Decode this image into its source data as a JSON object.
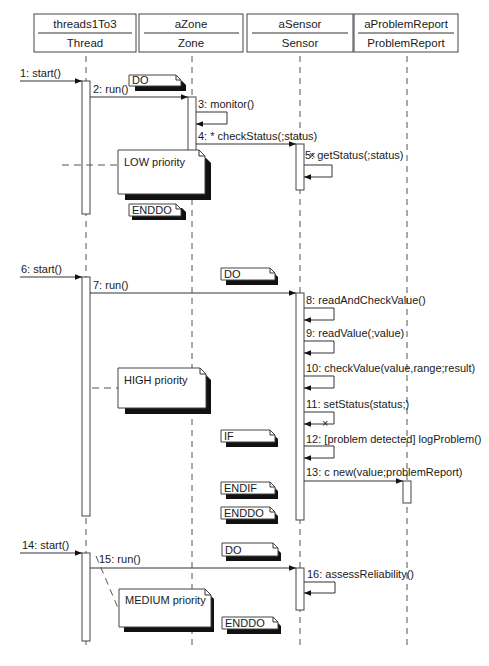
{
  "diagram": {
    "type": "UML sequence diagram",
    "lifelines": [
      {
        "id": "threads1To3",
        "object": "threads1To3",
        "class": "Thread",
        "x": 58
      },
      {
        "id": "aZone",
        "object": "aZone",
        "class": "Zone",
        "x": 193
      },
      {
        "id": "aSensor",
        "object": "aSensor",
        "class": "Sensor",
        "x": 300
      },
      {
        "id": "aProblemReport",
        "object": "aProblemReport",
        "class": "ProblemReport",
        "x": 407
      }
    ],
    "messages": [
      {
        "n": 1,
        "label": "1: start()"
      },
      {
        "n": 2,
        "label": "2: run()"
      },
      {
        "n": 3,
        "label": "3: monitor()"
      },
      {
        "n": 4,
        "label": "4: * checkStatus(;status)"
      },
      {
        "n": 5,
        "label": "5: getStatus(;status)"
      },
      {
        "n": 6,
        "label": "6: start()"
      },
      {
        "n": 7,
        "label": "7: run()"
      },
      {
        "n": 8,
        "label": "8: readAndCheckValue()"
      },
      {
        "n": 9,
        "label": "9: readValue(;value)"
      },
      {
        "n": 10,
        "label": "10: checkValue(value,range;result)"
      },
      {
        "n": 11,
        "label": "11: setStatus(status;)"
      },
      {
        "n": 12,
        "label": "12: [problem detected] logProblem()"
      },
      {
        "n": 13,
        "label": "13: c new(value;problemReport)"
      },
      {
        "n": 14,
        "label": "14: start()"
      },
      {
        "n": 15,
        "label": "15: run()"
      },
      {
        "n": 16,
        "label": "16: assessReliability()"
      }
    ],
    "notes": {
      "do1": "DO",
      "enddo1": "ENDDO",
      "low": "LOW priority",
      "do2": "DO",
      "high": "HIGH priority",
      "if": "IF",
      "endif": "ENDIF",
      "enddo2": "ENDDO",
      "do3": "DO",
      "medium": "MEDIUM priority",
      "enddo3": "ENDDO"
    }
  }
}
